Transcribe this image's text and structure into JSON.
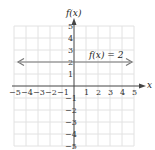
{
  "chart_data": {
    "type": "line",
    "title": "",
    "xlabel": "x",
    "ylabel": "f(x)",
    "xlim": [
      -5,
      5
    ],
    "ylim": [
      -5,
      5
    ],
    "grid": true,
    "x_ticks": [
      "-5",
      "-4",
      "-3",
      "-2",
      "-1",
      "1",
      "2",
      "3",
      "4",
      "5"
    ],
    "y_ticks": [
      "5",
      "4",
      "3",
      "2",
      "1",
      "-1",
      "-2",
      "-3",
      "-4",
      "-5"
    ],
    "series": [
      {
        "name": "f(x) = 2",
        "x": [
          -5,
          5
        ],
        "values": [
          2,
          2
        ],
        "arrows_both_ends": true,
        "color": "#666666"
      }
    ],
    "annotations": [
      {
        "text": "f(x) = 2",
        "x": 1.3,
        "y": 2.6
      }
    ]
  },
  "labels": {
    "y_axis": "f(x)",
    "x_axis": "x",
    "line_label": "f(x) = 2"
  },
  "colors": {
    "grid": "#e2e2e2",
    "axis": "#444444",
    "line": "#777777"
  }
}
